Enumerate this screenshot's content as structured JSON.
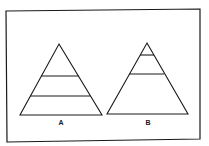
{
  "figure": {
    "type": "two-pyramid comparison diagram",
    "colors": {
      "stroke": "#1a1a1a",
      "background": "#ffffff"
    },
    "frame": {
      "points": [
        [
          6,
          11
        ],
        [
          200,
          9
        ],
        [
          200,
          139
        ],
        [
          7,
          142
        ]
      ]
    },
    "pyramids": [
      {
        "label": "A",
        "apex": [
          59,
          44
        ],
        "base_left": [
          20,
          115
        ],
        "base_right": [
          102,
          115
        ],
        "dividers": [
          {
            "y": 76,
            "x1": 41,
            "x2": 79
          },
          {
            "y": 96,
            "x1": 30,
            "x2": 90
          }
        ],
        "label_pos": [
          61,
          125
        ]
      },
      {
        "label": "B",
        "apex": [
          147,
          43
        ],
        "base_left": [
          107,
          114
        ],
        "base_right": [
          188,
          114
        ],
        "dividers": [
          {
            "y": 55,
            "x1": 140,
            "x2": 154
          },
          {
            "y": 74,
            "x1": 129,
            "x2": 164
          }
        ],
        "label_pos": [
          148,
          125
        ]
      }
    ]
  }
}
